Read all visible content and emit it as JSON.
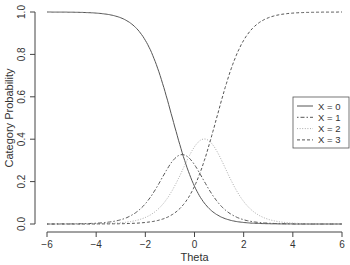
{
  "chart_data": {
    "type": "line",
    "title": "",
    "xlabel": "Theta",
    "ylabel": "Category Probability",
    "xlim": [
      -6,
      6
    ],
    "ylim": [
      0,
      1
    ],
    "x_ticks": [
      "-6",
      "-4",
      "-2",
      "0",
      "2",
      "4",
      "6"
    ],
    "y_ticks": [
      "0.0",
      "0.2",
      "0.4",
      "0.6",
      "0.8",
      "1.0"
    ],
    "grid": false,
    "legend_position": "right-center",
    "model": {
      "discrimination": 1.7,
      "thresholds": [
        -0.9,
        -0.1,
        0.9
      ]
    },
    "x": [
      -6,
      -5,
      -4,
      -3,
      -2,
      -1,
      -0.5,
      0,
      0.5,
      1,
      2,
      3,
      4,
      5,
      6
    ],
    "series": [
      {
        "name": "X = 0",
        "style": "solid",
        "color": "#555555",
        "values": [
          1.0,
          1.0,
          0.99,
          0.97,
          0.87,
          0.54,
          0.34,
          0.18,
          0.08,
          0.04,
          0.01,
          0.0,
          0.0,
          0.0,
          0.0
        ]
      },
      {
        "name": "X = 1",
        "style": "dotdash",
        "color": "#555555",
        "values": [
          0.0,
          0.0,
          0.01,
          0.03,
          0.12,
          0.29,
          0.33,
          0.29,
          0.2,
          0.11,
          0.03,
          0.01,
          0.0,
          0.0,
          0.0
        ]
      },
      {
        "name": "X = 2",
        "style": "dotted",
        "color": "#aaaaaa",
        "values": [
          0.0,
          0.0,
          0.0,
          0.0,
          0.01,
          0.1,
          0.21,
          0.32,
          0.37,
          0.34,
          0.17,
          0.06,
          0.02,
          0.01,
          0.0
        ]
      },
      {
        "name": "X = 3",
        "style": "dashed",
        "color": "#555555",
        "values": [
          0.0,
          0.0,
          0.0,
          0.0,
          0.0,
          0.07,
          0.12,
          0.21,
          0.35,
          0.51,
          0.79,
          0.93,
          0.98,
          0.99,
          1.0
        ]
      }
    ]
  },
  "legend": {
    "items": [
      "X = 0",
      "X = 1",
      "X = 2",
      "X = 3"
    ]
  }
}
